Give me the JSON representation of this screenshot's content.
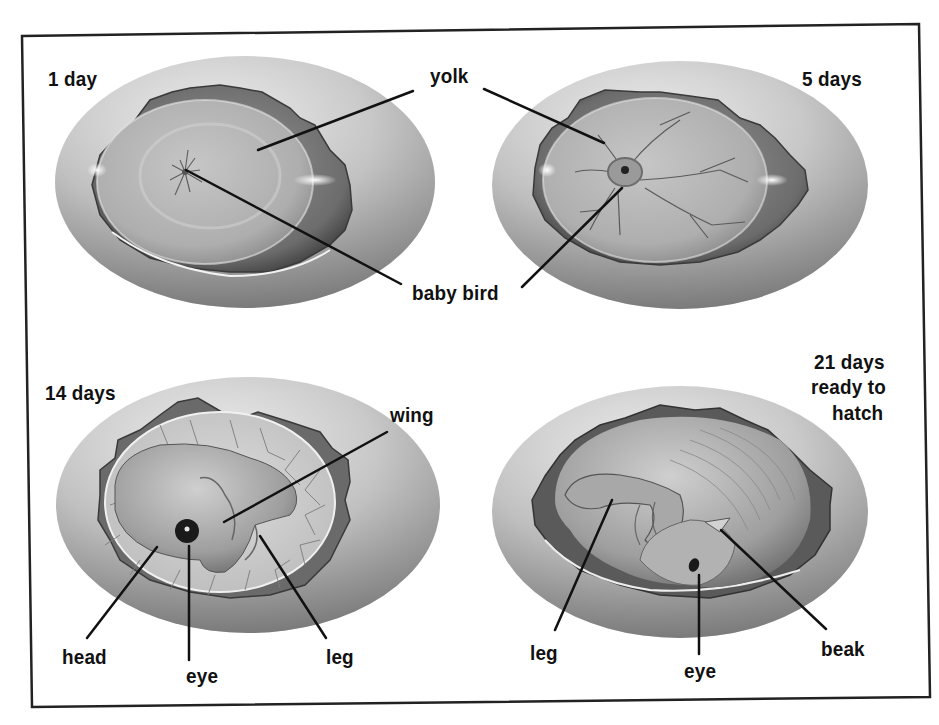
{
  "figure": {
    "colors": {
      "frame": "#222222",
      "label": "#111111",
      "leader_line": "#111111",
      "shell_light": "#e6e6e6",
      "shell_dark": "#8c8c8c",
      "cavity_dark": "#5e5e5e",
      "yolk": "#b9b9b9",
      "vessel": "#6a6a6a"
    },
    "panels": [
      {
        "id": "day-1",
        "stage_label": "1 day",
        "callouts": [
          {
            "label": "yolk"
          },
          {
            "label": "baby bird"
          }
        ]
      },
      {
        "id": "day-5",
        "stage_label": "5 days",
        "callouts": [
          {
            "label": "yolk"
          },
          {
            "label": "baby bird"
          }
        ]
      },
      {
        "id": "day-14",
        "stage_label": "14 days",
        "callouts": [
          {
            "label": "wing"
          },
          {
            "label": "head"
          },
          {
            "label": "eye"
          },
          {
            "label": "leg"
          }
        ]
      },
      {
        "id": "day-21",
        "stage_label_lines": [
          "21 days",
          "ready to",
          "hatch"
        ],
        "callouts": [
          {
            "label": "leg"
          },
          {
            "label": "eye"
          },
          {
            "label": "beak"
          }
        ]
      }
    ],
    "shared_labels": {
      "yolk": "yolk",
      "baby_bird": "baby bird"
    }
  }
}
